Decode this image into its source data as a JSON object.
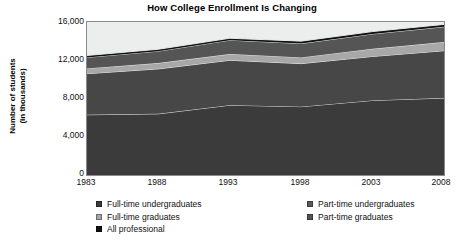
{
  "chart": {
    "title": "How College Enrollment Is Changing",
    "ylabel_line1": "Number of students",
    "ylabel_line2": "(in thousands)"
  },
  "chart_data": {
    "type": "area",
    "title": "How College Enrollment Is Changing",
    "xlabel": "",
    "ylabel": "Number of students (in thousands)",
    "stacked": true,
    "grid": false,
    "legend_position": "bottom",
    "x": [
      "1983",
      "1988",
      "1993",
      "1998",
      "2003",
      "2008"
    ],
    "categories": [
      "1983",
      "1988",
      "1993",
      "1998",
      "2003",
      "2008"
    ],
    "xlim": [
      1983,
      2008
    ],
    "ylim": [
      0,
      16000
    ],
    "yticks": [
      "0",
      "4,000",
      "8,000",
      "12,000",
      "16,000"
    ],
    "ytick_values": [
      0,
      4000,
      8000,
      12000,
      16000
    ],
    "series": [
      {
        "name": "Full-time undergraduates",
        "color": "#3b3b3b",
        "values": [
          6300,
          6400,
          7300,
          7150,
          7800,
          8050
        ]
      },
      {
        "name": "Part-time undergraduates",
        "color": "#474747",
        "values": [
          4300,
          4700,
          4700,
          4500,
          4600,
          4950
        ]
      },
      {
        "name": "Full-time graduates",
        "color": "#a8a8a8",
        "values": [
          550,
          600,
          650,
          650,
          800,
          900
        ]
      },
      {
        "name": "Part-time graduates",
        "color": "#555555",
        "values": [
          1150,
          1250,
          1450,
          1450,
          1550,
          1600
        ]
      },
      {
        "name": "All professional",
        "color": "#111111",
        "values": [
          200,
          200,
          200,
          250,
          250,
          250
        ]
      }
    ],
    "totals": [
      12500,
      13150,
      14300,
      14000,
      15000,
      15750
    ]
  },
  "legend": {
    "left": [
      {
        "label": "Full-time undergraduates",
        "color": "#3b3b3b"
      },
      {
        "label": "Full-time graduates",
        "color": "#a8a8a8"
      },
      {
        "label": "All professional",
        "color": "#111111"
      }
    ],
    "right": [
      {
        "label": "Part-time undergraduates",
        "color": "#5a5a5a"
      },
      {
        "label": "Part-time graduates",
        "color": "#555555"
      }
    ]
  }
}
